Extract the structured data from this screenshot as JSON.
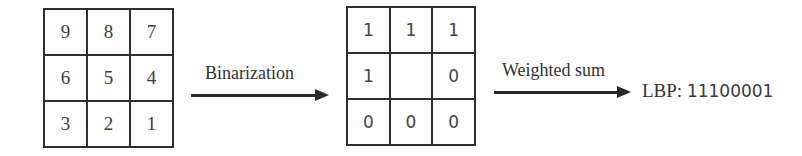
{
  "input_grid": {
    "cells": [
      "9",
      "8",
      "7",
      "6",
      "5",
      "4",
      "3",
      "2",
      "1"
    ]
  },
  "binary_grid": {
    "cells": [
      "1",
      "1",
      "1",
      "1",
      "",
      "0",
      "0",
      "0",
      "0"
    ]
  },
  "arrows": {
    "binarization_label": "Binarization",
    "weighted_sum_label": "Weighted sum"
  },
  "result": {
    "prefix": "LBP:",
    "code": "11100001"
  }
}
